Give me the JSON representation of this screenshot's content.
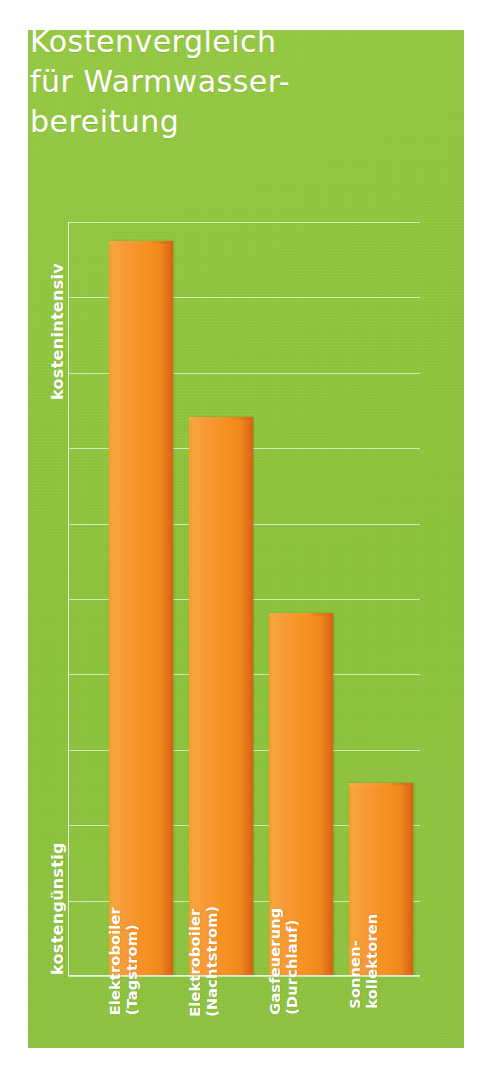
{
  "title": "Kostenvergleich\nfür Warmwasser-\nbereitung",
  "axis": {
    "y_top_label": "kostenintensiv",
    "y_bottom_label": "kostengünstig"
  },
  "colors": {
    "background_green": "#8fc63d",
    "bar_orange": "#f6911f",
    "bar_orange_shadow": "#d9620f",
    "text_white": "#ffffff",
    "gridline": "#ffffff"
  },
  "chart_data": {
    "type": "bar",
    "xlabel": "",
    "ylabel": "kostenintensiv / kostengünstig",
    "ylim": [
      0,
      10
    ],
    "grid": true,
    "gridline_count": 10,
    "legend": "none",
    "categories": [
      "Elektroboiler (Tagstrom)",
      "Elektroboiler (Nachtstrom)",
      "Gasfeuerung (Durchlauf)",
      "Sonnenkollektoren"
    ],
    "category_labels": [
      "Elektroboiler\n(Tagstrom)",
      "Elektroboiler\n(Nachtstrom)",
      "Gasfeuerung\n(Durchlauf)",
      "Sonnen-\nkollektoren"
    ],
    "values": [
      9.73,
      7.4,
      4.8,
      2.55
    ],
    "value_unit": "relative cost (unlabeled axis)",
    "annotations": [
      "kostenintensiv (top of y-axis)",
      "kostengünstig (bottom of y-axis)"
    ]
  }
}
